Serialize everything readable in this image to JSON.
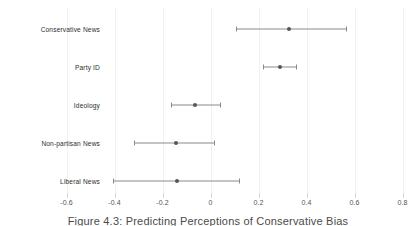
{
  "chart_data": {
    "type": "scatter",
    "title": "",
    "caption": "Figure 4.3: Predicting Perceptions of Conservative Bias",
    "xlabel": "",
    "ylabel": "",
    "xlim": [
      -0.7,
      0.85
    ],
    "xticks": [
      -0.6,
      -0.4,
      -0.2,
      0,
      0.2,
      0.4,
      0.6,
      0.8
    ],
    "xtick_labels": [
      "-0.6",
      "-0.4",
      "-0.2",
      "0",
      "0.2",
      "0.4",
      "0.6",
      "0.8"
    ],
    "grid": true,
    "legend": "none",
    "categories": [
      "Conservative News",
      "Party ID",
      "Ideology",
      "Non-partisan News",
      "Liberal News"
    ],
    "series": [
      {
        "name": "Coefficient estimate with 95% confidence interval",
        "points": [
          {
            "category": "Conservative News",
            "estimate": 0.325,
            "ci_low": 0.105,
            "ci_high": 0.565
          },
          {
            "category": "Party ID",
            "estimate": 0.29,
            "ci_low": 0.22,
            "ci_high": 0.355
          },
          {
            "category": "Ideology",
            "estimate": -0.065,
            "ci_low": -0.165,
            "ci_high": 0.04
          },
          {
            "category": "Non-partisan News",
            "estimate": -0.145,
            "ci_low": -0.32,
            "ci_high": 0.015
          },
          {
            "category": "Liberal News",
            "estimate": -0.14,
            "ci_low": -0.405,
            "ci_high": 0.12
          }
        ]
      }
    ],
    "colors": {
      "point": "#555555",
      "interval": "#8a8a8a",
      "grid": "#f0f0f0",
      "text": "#2e2e2e",
      "background": "#ffffff"
    }
  }
}
